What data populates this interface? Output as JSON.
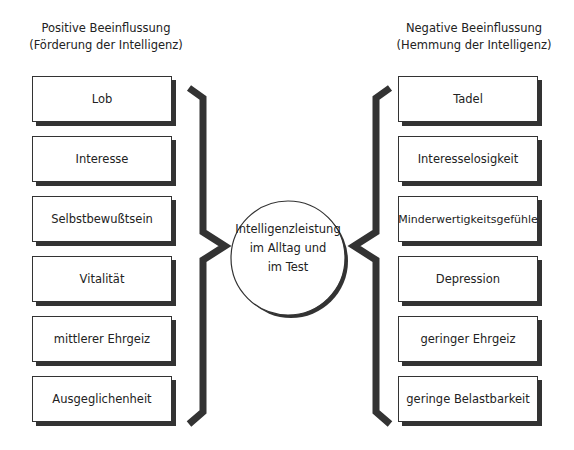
{
  "diagram": {
    "left": {
      "heading_line1": "Positive Beeinflussung",
      "heading_line2": "(Förderung der Intelligenz)",
      "items": [
        "Lob",
        "Interesse",
        "Selbstbewußtsein",
        "Vitalität",
        "mittlerer Ehrgeiz",
        "Ausgeglichenheit"
      ]
    },
    "right": {
      "heading_line1": "Negative Beeinflussung",
      "heading_line2": "(Hemmung der Intelligenz)",
      "items": [
        "Tadel",
        "Interesselosigkeit",
        "Minderwertigkeitsgefühle",
        "Depression",
        "geringer Ehrgeiz",
        "geringe Belastbarkeit"
      ]
    },
    "center": {
      "line1": "Intelligenzleistung",
      "line2": "im Alltag und",
      "line3": "im Test"
    },
    "colors": {
      "stroke": "#333333",
      "shadow": "#333333",
      "background": "#ffffff"
    }
  }
}
